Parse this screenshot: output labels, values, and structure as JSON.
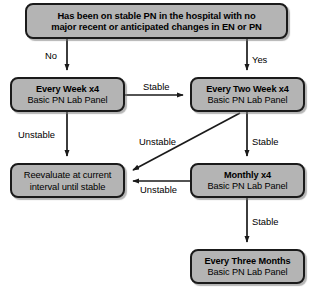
{
  "diagram": {
    "background_color": "#ffffff",
    "node_fill_color": "#b4b4b4",
    "node_border_color": "#1a1a1a",
    "text_color": "#000000",
    "nodes": [
      {
        "id": "question",
        "line1": "Has been on stable PN in the hospital with no",
        "line2": "major recent or anticipated changes in EN or PN"
      },
      {
        "id": "weekly",
        "line1": "Every Week x4",
        "line2": "Basic PN Lab Panel"
      },
      {
        "id": "twoweek",
        "line1": "Every Two Week x4",
        "line2": "Basic PN Lab Panel"
      },
      {
        "id": "reevaluate",
        "line1": "Reevaluate at current",
        "line2": "interval until stable"
      },
      {
        "id": "monthly",
        "line1": "Monthly x4",
        "line2": "Basic PN Lab Panel"
      },
      {
        "id": "threemonths",
        "line1": "Every Three Months",
        "line2": "Basic PN Lab Panel"
      }
    ],
    "edges": [
      {
        "id": "question-to-weekly",
        "label": "No",
        "from": "question",
        "to": "weekly"
      },
      {
        "id": "question-to-twoweek",
        "label": "Yes",
        "from": "question",
        "to": "twoweek"
      },
      {
        "id": "weekly-to-twoweek",
        "label": "Stable",
        "from": "weekly",
        "to": "twoweek"
      },
      {
        "id": "weekly-to-reeval",
        "label": "Unstable",
        "from": "weekly",
        "to": "reevaluate"
      },
      {
        "id": "twoweek-to-reeval",
        "label": "Unstable",
        "from": "twoweek",
        "to": "reevaluate"
      },
      {
        "id": "twoweek-to-monthly",
        "label": "Stable",
        "from": "twoweek",
        "to": "monthly"
      },
      {
        "id": "monthly-to-reeval",
        "label": "Unstable",
        "from": "monthly",
        "to": "reevaluate"
      },
      {
        "id": "monthly-to-three",
        "label": "Stable",
        "from": "monthly",
        "to": "threemonths"
      }
    ]
  }
}
